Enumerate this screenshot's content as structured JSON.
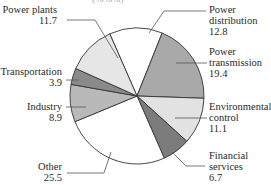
{
  "chart_data": {
    "type": "pie",
    "title": "",
    "unit": "%",
    "start_angle_deg": -24,
    "direction": "clockwise",
    "slices": [
      {
        "label": "Power distribution",
        "value": 12.8,
        "color": "#ffffff"
      },
      {
        "label": "Power transmission",
        "value": 19.4,
        "color": "#a9a9a9"
      },
      {
        "label": "Environmental control",
        "value": 11.1,
        "color": "#e2e2e2"
      },
      {
        "label": "Financial services",
        "value": 6.7,
        "color": "#7c7c7c"
      },
      {
        "label": "Other",
        "value": 25.5,
        "color": "#ffffff"
      },
      {
        "label": "Industry",
        "value": 8.9,
        "color": "#b9b9b9"
      },
      {
        "label": "Transportation",
        "value": 3.9,
        "color": "#8a8a8a"
      },
      {
        "label": "Power plants",
        "value": 11.7,
        "color": "#e6e6e6"
      }
    ],
    "legend_position": "none",
    "grid": false
  },
  "labels": {
    "top_partial": "(%%%)",
    "power_plants": {
      "line1": "Power plants",
      "value": "11.7"
    },
    "power_distribution": {
      "line1": "Power",
      "line2": "distribution",
      "value": "12.8"
    },
    "power_transmission": {
      "line1": "Power",
      "line2": "transmission",
      "value": "19.4"
    },
    "environmental_control": {
      "line1": "Environmental",
      "line2": "control",
      "value": "11.1"
    },
    "financial_services": {
      "line1": "Financial",
      "line2": "services",
      "value": "6.7"
    },
    "other": {
      "line1": "Other",
      "value": "25.5"
    },
    "industry": {
      "line1": "Industry",
      "value": "8.9"
    },
    "transportation": {
      "line1": "Transportation",
      "value": "3.9"
    }
  },
  "style": {
    "outline_color": "#333333",
    "leader_color": "#555555"
  }
}
